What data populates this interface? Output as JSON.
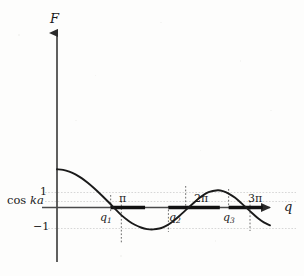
{
  "figure": {
    "title": "",
    "background_color": "#fdfdfc",
    "curve_color": "#1a1a1a",
    "axis_color": "#3a3a3a",
    "grid_color": "#cfcfcf",
    "dotted_color": "#555555",
    "band_color": "#111111"
  },
  "axes": {
    "y_axis_label": "F",
    "x_axis_label": "q",
    "y_ticks": [
      {
        "label": "1",
        "value": 1
      },
      {
        "label": "cos ka",
        "value": 0.55,
        "text_plain": "cos",
        "text_italic": "ka"
      },
      {
        "label": "−1",
        "value": -1
      }
    ],
    "x_ticks": [
      {
        "label": "q₁",
        "base": "q",
        "sub": "1",
        "value": 2.62
      },
      {
        "label": "π",
        "value": 3.1416
      },
      {
        "label": "q₂",
        "base": "q",
        "sub": "2",
        "value": 5.44
      },
      {
        "label": "2π",
        "value": 6.2832
      },
      {
        "label": "q₃",
        "base": "q",
        "sub": "3",
        "value": 8.38
      },
      {
        "label": "3π",
        "value": 9.4248
      }
    ],
    "xlim": [
      -0.55,
      10.4
    ],
    "ylim": [
      -2.25,
      3.55
    ],
    "grid": "horizontal dotted at y=1, y=cos ka, y=-1"
  },
  "chart_data": {
    "type": "line",
    "title": "",
    "xlabel": "q",
    "ylabel": "F",
    "series": [
      {
        "name": "F(q)",
        "points": [
          [
            0.0,
            2.62
          ],
          [
            0.3,
            2.58
          ],
          [
            0.6,
            2.46
          ],
          [
            0.9,
            2.27
          ],
          [
            1.2,
            2.01
          ],
          [
            1.5,
            1.69
          ],
          [
            1.8,
            1.33
          ],
          [
            2.1,
            0.94
          ],
          [
            2.4,
            0.53
          ],
          [
            2.62,
            0.22
          ],
          [
            2.8,
            -0.04
          ],
          [
            3.1416,
            -0.52
          ],
          [
            3.5,
            -0.92
          ],
          [
            3.8,
            -1.18
          ],
          [
            4.1,
            -1.37
          ],
          [
            4.4,
            -1.48
          ],
          [
            4.71,
            -1.5
          ],
          [
            5.0,
            -1.44
          ],
          [
            5.2,
            -1.34
          ],
          [
            5.44,
            -1.16
          ],
          [
            5.7,
            -0.9
          ],
          [
            6.0,
            -0.55
          ],
          [
            6.2832,
            -0.18
          ],
          [
            6.6,
            0.22
          ],
          [
            7.0,
            0.7
          ],
          [
            7.4,
            1.05
          ],
          [
            7.85,
            1.18
          ],
          [
            8.1,
            1.12
          ],
          [
            8.38,
            0.95
          ],
          [
            8.7,
            0.66
          ],
          [
            9.0,
            0.3
          ],
          [
            9.4248,
            -0.25
          ],
          [
            9.8,
            -0.72
          ],
          [
            10.1,
            -1.02
          ],
          [
            10.4,
            -1.22
          ]
        ]
      }
    ],
    "allowed_bands": [
      {
        "name": "band-1",
        "q_start": 2.62,
        "q_end": 4.3,
        "label_start": "q₁"
      },
      {
        "name": "band-2",
        "q_start": 5.44,
        "q_end": 7.95,
        "label_start": "q₂"
      },
      {
        "name": "band-3",
        "q_start": 8.38,
        "q_end": 10.05,
        "label_start": "q₃"
      }
    ],
    "band_axis_y": 0,
    "curve_start_value": 2.62,
    "legend": null,
    "annotations": [
      "dotted vertical drop line at q₁",
      "dotted vertical drop line at π",
      "dotted vertical drop line at q₂",
      "dotted vertical drop line at 2π",
      "dotted vertical drop line at q₃",
      "dotted vertical drop line at 3π"
    ]
  }
}
